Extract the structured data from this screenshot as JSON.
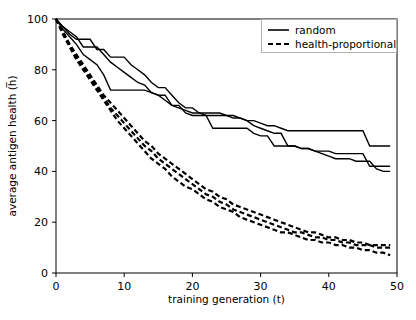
{
  "chart_data": {
    "type": "line",
    "title": "",
    "xlabel": "training generation (t)",
    "ylabel": "average antigen health (h̅)",
    "xlim": [
      0,
      50
    ],
    "ylim": [
      0,
      100
    ],
    "xticks": [
      0,
      10,
      20,
      30,
      40,
      50
    ],
    "xticklabels": [
      "0",
      "10",
      "20",
      "30",
      "40",
      "50"
    ],
    "yticks": [
      0,
      20,
      40,
      60,
      80,
      100
    ],
    "yticklabels": [
      "0",
      "20",
      "40",
      "60",
      "80",
      "100"
    ],
    "grid": false,
    "legend_position": "upper right",
    "legend_entries": [
      {
        "label": "random",
        "style": "solid"
      },
      {
        "label": "health-proportional",
        "style": "dashed"
      }
    ],
    "x": [
      0,
      1,
      2,
      3,
      4,
      5,
      6,
      7,
      8,
      9,
      10,
      11,
      12,
      13,
      14,
      15,
      16,
      17,
      18,
      19,
      20,
      21,
      22,
      23,
      24,
      25,
      26,
      27,
      28,
      29,
      30,
      31,
      32,
      33,
      34,
      35,
      36,
      37,
      38,
      39,
      40,
      41,
      42,
      43,
      44,
      45,
      46,
      47,
      48,
      49
    ],
    "series": [
      {
        "name": "random-run-1",
        "style": "solid",
        "values": [
          100,
          97,
          94,
          92,
          92,
          92,
          88,
          88,
          85,
          85,
          85,
          82,
          80,
          78,
          75,
          73,
          73,
          70,
          67,
          65,
          65,
          63,
          62,
          62,
          62,
          62,
          62,
          61,
          60,
          60,
          59,
          58,
          58,
          57,
          56,
          56,
          56,
          56,
          56,
          56,
          56,
          56,
          56,
          56,
          56,
          56,
          50,
          50,
          50,
          50
        ]
      },
      {
        "name": "random-run-2",
        "style": "solid",
        "values": [
          100,
          97,
          95,
          93,
          89,
          89,
          89,
          86,
          83,
          81,
          79,
          77,
          75,
          74,
          71,
          70,
          70,
          66,
          66,
          63,
          62,
          62,
          62,
          57,
          57,
          57,
          57,
          57,
          57,
          55,
          54,
          54,
          50,
          50,
          50,
          50,
          49,
          49,
          48,
          48,
          48,
          47,
          47,
          47,
          47,
          47,
          42,
          42,
          42,
          42
        ]
      },
      {
        "name": "random-run-3",
        "style": "solid",
        "values": [
          100,
          96,
          93,
          90,
          86,
          84,
          82,
          78,
          72,
          72,
          72,
          72,
          72,
          72,
          71,
          70,
          68,
          66,
          65,
          64,
          63,
          63,
          63,
          63,
          63,
          62,
          61,
          61,
          60,
          58,
          57,
          56,
          55,
          55,
          50,
          50,
          49,
          49,
          48,
          47,
          46,
          45,
          45,
          45,
          44,
          44,
          44,
          41,
          40,
          40
        ]
      },
      {
        "name": "health-proportional-run-1",
        "style": "dashed",
        "values": [
          100,
          95,
          90,
          86,
          82,
          78,
          74,
          70,
          67,
          64,
          61,
          58,
          55,
          52,
          50,
          47,
          45,
          43,
          41,
          39,
          37,
          35,
          33,
          32,
          30,
          29,
          27,
          26,
          25,
          24,
          23,
          22,
          21,
          20,
          19,
          18,
          17,
          16,
          16,
          15,
          14,
          14,
          13,
          13,
          12,
          12,
          11,
          11,
          11,
          11
        ]
      },
      {
        "name": "health-proportional-run-2",
        "style": "dashed",
        "values": [
          100,
          95,
          90,
          85,
          81,
          77,
          73,
          69,
          65,
          62,
          59,
          56,
          53,
          50,
          48,
          45,
          43,
          41,
          39,
          37,
          35,
          33,
          31,
          30,
          28,
          27,
          25,
          24,
          23,
          22,
          21,
          20,
          19,
          18,
          17,
          16,
          16,
          15,
          14,
          14,
          13,
          13,
          12,
          12,
          11,
          11,
          11,
          10,
          10,
          10
        ]
      },
      {
        "name": "health-proportional-run-3",
        "style": "dashed",
        "values": [
          100,
          94,
          89,
          84,
          80,
          76,
          72,
          68,
          64,
          60,
          57,
          54,
          51,
          48,
          45,
          43,
          41,
          38,
          36,
          34,
          33,
          31,
          29,
          28,
          26,
          25,
          24,
          22,
          21,
          20,
          19,
          18,
          17,
          16,
          16,
          15,
          14,
          13,
          13,
          12,
          12,
          11,
          11,
          10,
          10,
          9,
          9,
          8,
          8,
          7
        ]
      }
    ]
  }
}
